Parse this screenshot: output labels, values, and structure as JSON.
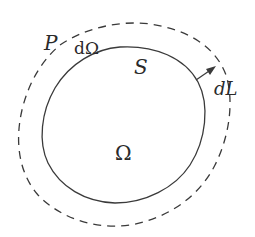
{
  "diagram": {
    "type": "region-boundary-diagram",
    "colors": {
      "background": "#ffffff",
      "stroke": "#3a3a3a",
      "text": "#2a2a2a"
    },
    "elements": {
      "inner_region": {
        "label": "Ω",
        "description": "region enclosed by solid curve"
      },
      "boundary": {
        "label": "dΩ",
        "style": "solid"
      },
      "surface": {
        "label": "S"
      },
      "outer_boundary": {
        "label": "P",
        "style": "dashed"
      },
      "normal_displacement": {
        "label": "dL",
        "style": "arrow"
      }
    }
  }
}
